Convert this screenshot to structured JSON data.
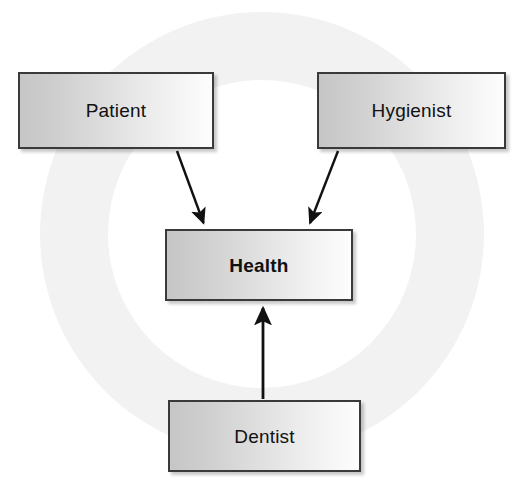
{
  "diagram": {
    "title_text": "",
    "background_shape": "ring",
    "colors": {
      "ring_fill": "#f2f2f2",
      "page_background": "#ffffff",
      "box_border": "#3a3a3a",
      "box_fill_dark": "#c6c6c6",
      "box_fill_light": "#fdfdfd",
      "arrow": "#111111",
      "text": "#111111"
    },
    "nodes": [
      {
        "id": "patient",
        "label": "Patient",
        "bold": false
      },
      {
        "id": "hygienist",
        "label": "Hygienist",
        "bold": false
      },
      {
        "id": "health",
        "label": "Health",
        "bold": true
      },
      {
        "id": "dentist",
        "label": "Dentist",
        "bold": false
      }
    ],
    "edges": [
      {
        "from": "patient",
        "to": "health",
        "direction": "down-right",
        "style": "solid-arrow"
      },
      {
        "from": "hygienist",
        "to": "health",
        "direction": "down-left",
        "style": "solid-arrow"
      },
      {
        "from": "dentist",
        "to": "health",
        "direction": "up",
        "style": "solid-arrow"
      }
    ]
  }
}
